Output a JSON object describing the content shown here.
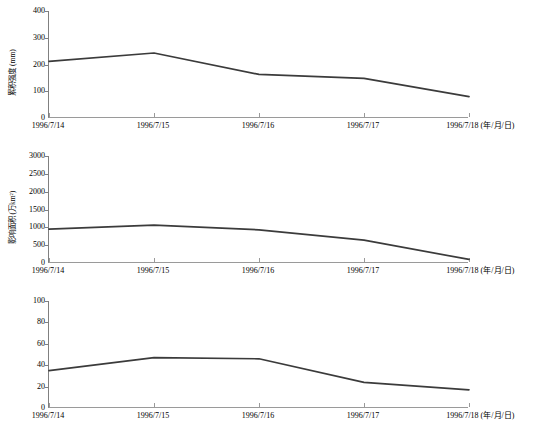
{
  "figure": {
    "panel_count": 3,
    "x_axis_unit_note": "(年/月/日)",
    "categories": [
      "1996/7/14",
      "1996/7/15",
      "1996/7/16",
      "1996/7/17",
      "1996/7/18"
    ],
    "line_color": "#3b3b3b",
    "axis_color": "#808080"
  },
  "chart_data": [
    {
      "type": "line",
      "title": "",
      "xlabel": "1996/7/18 (年/月/日)",
      "ylabel": "瞬时强度 (mm)",
      "categories": [
        "1996/7/14",
        "1996/7/15",
        "1996/7/16",
        "1996/7/17",
        "1996/7/18"
      ],
      "values": [
        212,
        243,
        163,
        148,
        80
      ],
      "ylim": [
        0,
        400
      ],
      "yticks": [
        0,
        100,
        200,
        300,
        400
      ],
      "ytick_labels": [
        "0",
        "100",
        "200",
        "300",
        "400"
      ],
      "grid": false,
      "legend": "none"
    },
    {
      "type": "line",
      "title": "",
      "xlabel": "1996/7/18 (年/月/日)",
      "ylabel": "累积强度 (mm)",
      "categories": [
        "1996/7/14",
        "1996/7/15",
        "1996/7/16",
        "1996/7/17",
        "1996/7/18"
      ],
      "values": [
        950,
        1060,
        930,
        640,
        100
      ],
      "ylim": [
        0,
        3000
      ],
      "yticks": [
        0,
        500,
        1000,
        1500,
        2000,
        2500,
        3000
      ],
      "ytick_labels": [
        "0",
        "500",
        "1000",
        "1500",
        "2000",
        "2500",
        "3000"
      ],
      "grid": false,
      "legend": "none"
    },
    {
      "type": "line",
      "title": "",
      "xlabel": "1996/7/18 (年/月/日)",
      "ylabel": "影响面积 (万km²)",
      "categories": [
        "1996/7/14",
        "1996/7/15",
        "1996/7/16",
        "1996/7/17",
        "1996/7/18"
      ],
      "values": [
        35,
        47,
        46,
        24,
        17
      ],
      "ylim": [
        0,
        100
      ],
      "yticks": [
        0,
        20,
        40,
        60,
        80,
        100
      ],
      "ytick_labels": [
        "0",
        "20",
        "40",
        "60",
        "80",
        "100"
      ],
      "grid": false,
      "legend": "none"
    }
  ]
}
